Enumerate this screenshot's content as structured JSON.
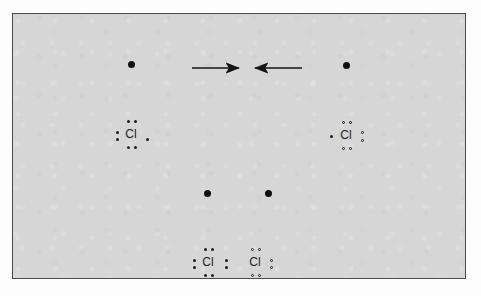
{
  "figure": {
    "panel": {
      "background_color": "#d6d6d6",
      "border_color": "#4a4a4a"
    },
    "ink_color": "#1b1b1b",
    "nucleus_color": "#101010"
  },
  "atoms": {
    "left_atom": {
      "name": "chlorine-atom-left",
      "element_symbol": "Cl",
      "cloud_center": {
        "x": 118,
        "y": 50
      },
      "cloud_radius": 35,
      "nucleus_label": "nucleus",
      "electron_dot_style": "filled",
      "lewis_dot_groups": {
        "top": 2,
        "left": 2,
        "bottom": 2,
        "right": 1
      },
      "valence_electrons": 7
    },
    "right_atom": {
      "name": "chlorine-atom-right",
      "element_symbol": "Cl",
      "cloud_center": {
        "x": 333,
        "y": 51
      },
      "cloud_radius": 35,
      "nucleus_label": "nucleus",
      "electron_dot_style": "hollow",
      "lewis_dot_groups": {
        "top": 2,
        "left": 1,
        "bottom": 2,
        "right": 2
      },
      "valence_electrons": 7
    },
    "molecule": {
      "name": "chlorine-molecule",
      "formula": "Cl2",
      "left_cloud_center": {
        "x": 194,
        "y": 179
      },
      "right_cloud_center": {
        "x": 255,
        "y": 179
      },
      "cloud_radius": 33,
      "shared_pair_count": 1,
      "left_symbol": "Cl",
      "right_symbol": "Cl"
    }
  },
  "arrows": [
    {
      "name": "arrow-right",
      "direction": "right",
      "x1": 179,
      "x2": 229,
      "y": 54
    },
    {
      "name": "arrow-left",
      "direction": "left",
      "x1": 289,
      "x2": 239,
      "y": 54
    }
  ],
  "labels": {
    "left_symbol": "Cl",
    "right_symbol": "Cl",
    "molecule_left_symbol": "Cl",
    "molecule_right_symbol": "Cl"
  }
}
